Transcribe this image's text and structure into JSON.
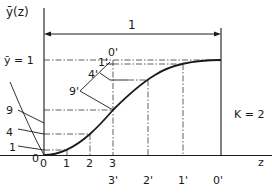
{
  "diagram": {
    "y_axis_label": "ȳ(z)",
    "x_axis_label": "z",
    "y_level_label": "ȳ = 1",
    "dimension_label": "1",
    "parameter_label": "K = 2",
    "x_ticks": [
      "0",
      "1",
      "2",
      "3"
    ],
    "x_ticks_primed": [
      "3'",
      "2'",
      "1'",
      "0'"
    ],
    "left_labels": [
      "9",
      "4",
      "1",
      "0"
    ],
    "construction_labels": [
      "0'",
      "1'",
      "4'",
      "9'"
    ],
    "colors": {
      "ink": "#1a1a1a",
      "background": "#ffffff"
    }
  }
}
